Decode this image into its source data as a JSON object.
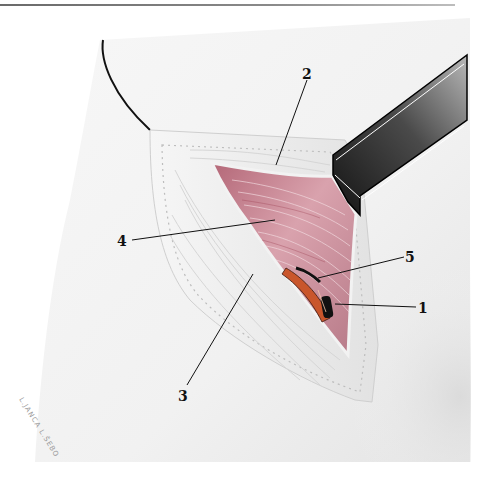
{
  "page": {
    "header_text": "",
    "has_header_rule": true
  },
  "figure": {
    "type": "surgical-illustration",
    "background_color": "#f4f4f4",
    "muscle_color": "#c98a96",
    "retractor_color": "#2a2a2a",
    "labels": [
      {
        "id": "1",
        "text": "1",
        "x": 418,
        "y": 301
      },
      {
        "id": "2",
        "text": "2",
        "x": 302,
        "y": 67
      },
      {
        "id": "3",
        "text": "3",
        "x": 178,
        "y": 389
      },
      {
        "id": "4",
        "text": "4",
        "x": 117,
        "y": 234
      },
      {
        "id": "5",
        "text": "5",
        "x": 405,
        "y": 250
      }
    ],
    "signature": "L.JANCA L.ŠEBO"
  }
}
